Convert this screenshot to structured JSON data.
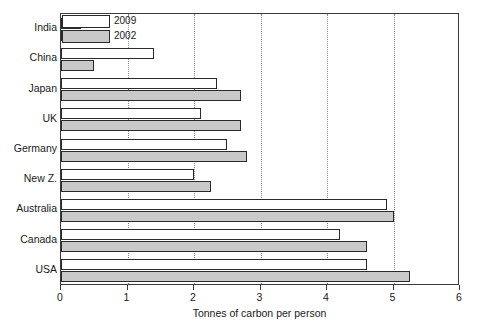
{
  "chart_data": {
    "type": "bar",
    "orientation": "horizontal",
    "title": "",
    "xlabel": "Tonnes of carbon per person",
    "ylabel": "",
    "xlim": [
      0,
      6
    ],
    "xticks": [
      "0",
      "1",
      "2",
      "3",
      "4",
      "5",
      "6"
    ],
    "grid": "vertical-dotted",
    "legend_position": "top-left-inside",
    "categories": [
      "India",
      "China",
      "Japan",
      "UK",
      "Germany",
      "New Z.",
      "Australia",
      "Canada",
      "USA"
    ],
    "series": [
      {
        "name": "2009",
        "color": "#ffffff",
        "values": [
          0.3,
          1.4,
          2.35,
          2.1,
          2.5,
          2.0,
          4.9,
          4.2,
          4.6
        ]
      },
      {
        "name": "2002",
        "color": "#c9c9c9",
        "values": [
          0.3,
          0.5,
          2.7,
          2.7,
          2.8,
          2.25,
          5.0,
          4.6,
          5.25
        ]
      }
    ]
  },
  "legend": {
    "entries": [
      {
        "label": "2009",
        "swatch": "white-bar-swatch"
      },
      {
        "label": "2002",
        "swatch": "gray-bar-swatch"
      }
    ]
  },
  "axes": {
    "x_title": "Tonnes of carbon per person",
    "x_tick_labels": [
      "0",
      "1",
      "2",
      "3",
      "4",
      "5",
      "6"
    ],
    "y_tick_labels": [
      "India",
      "China",
      "Japan",
      "UK",
      "Germany",
      "New Z.",
      "Australia",
      "Canada",
      "USA"
    ]
  }
}
